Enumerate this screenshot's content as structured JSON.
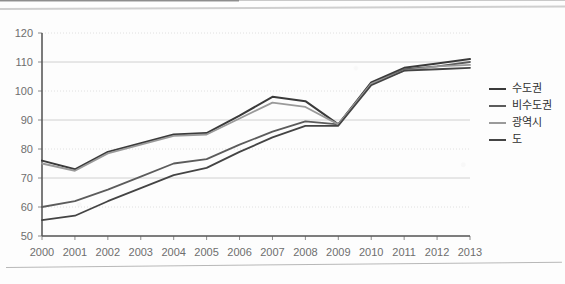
{
  "chart_data": {
    "type": "line",
    "title": "",
    "xlabel": "",
    "ylabel": "",
    "x": [
      2000,
      2001,
      2002,
      2003,
      2004,
      2005,
      2006,
      2007,
      2008,
      2009,
      2010,
      2011,
      2012,
      2013
    ],
    "categories": [
      "2000",
      "2001",
      "2002",
      "2003",
      "2004",
      "2005",
      "2006",
      "2007",
      "2008",
      "2009",
      "2010",
      "2011",
      "2012",
      "2013"
    ],
    "xlim": [
      2000,
      2013
    ],
    "ylim": [
      50,
      120
    ],
    "yticks": [
      50,
      60,
      70,
      80,
      90,
      100,
      110,
      120
    ],
    "ytick_labels": [
      "50",
      "60",
      "70",
      "80",
      "90",
      "100",
      "110",
      "120"
    ],
    "grid": true,
    "legend_position": "right",
    "series": [
      {
        "name": "수도권",
        "color": "#3a3a3a",
        "width": 2.0,
        "values": [
          76.0,
          73.0,
          79.0,
          82.0,
          85.0,
          85.5,
          91.5,
          98.0,
          96.5,
          88.5,
          103.0,
          108.0,
          109.5,
          111.0
        ]
      },
      {
        "name": "비수도권",
        "color": "#5c5c5c",
        "width": 1.8,
        "values": [
          60.0,
          62.0,
          66.0,
          70.5,
          75.0,
          76.5,
          81.5,
          86.0,
          89.5,
          88.5,
          102.5,
          107.5,
          108.5,
          110.0
        ]
      },
      {
        "name": "광역시",
        "color": "#9a9a9a",
        "width": 1.8,
        "values": [
          75.0,
          72.5,
          78.5,
          81.5,
          84.5,
          85.0,
          90.5,
          96.0,
          94.5,
          88.5,
          102.5,
          107.0,
          108.5,
          109.0
        ]
      },
      {
        "name": "도",
        "color": "#444444",
        "width": 1.8,
        "values": [
          55.5,
          57.0,
          62.0,
          66.5,
          71.0,
          73.5,
          79.0,
          84.0,
          88.0,
          88.0,
          102.0,
          107.0,
          107.5,
          108.0
        ]
      }
    ]
  },
  "legend": {
    "items": [
      {
        "label": "수도권"
      },
      {
        "label": "비수도권"
      },
      {
        "label": "광역시"
      },
      {
        "label": "도"
      }
    ]
  }
}
